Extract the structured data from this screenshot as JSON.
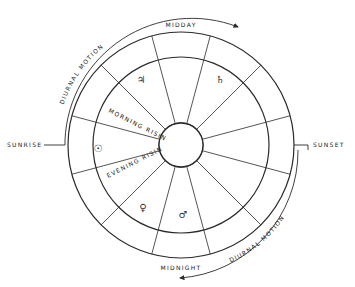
{
  "diagram": {
    "geometry": {
      "cx": 181,
      "cy": 145,
      "outer_r": 113,
      "middle_r": 88,
      "inner_r": 22,
      "motion_r": 128,
      "stroke": "#2a2a2a"
    },
    "cardinal_labels": {
      "top": "MIDDAY",
      "bottom": "MIDNIGHT",
      "left": "SUNRISE",
      "right": "SUNSET"
    },
    "motion_labels": {
      "upper": "DIURNAL MOTION",
      "lower": "DIURNAL MOTION"
    },
    "region_labels": {
      "morning": "MORNING RISING",
      "evening": "EVENING RISING"
    },
    "planets": [
      {
        "name": "Jupiter",
        "glyph": "♃",
        "x": 141,
        "y": 83
      },
      {
        "name": "Saturn",
        "glyph": "♄",
        "x": 220,
        "y": 83
      },
      {
        "name": "Sun",
        "glyph": "☉",
        "x": 98,
        "y": 152
      },
      {
        "name": "Venus",
        "glyph": "♀",
        "x": 143,
        "y": 211
      },
      {
        "name": "Mars",
        "glyph": "♂",
        "x": 183,
        "y": 218
      }
    ],
    "house_divider_angles_deg": [
      15,
      45,
      75,
      105,
      135,
      165,
      195,
      225,
      255,
      285,
      315,
      345
    ]
  }
}
